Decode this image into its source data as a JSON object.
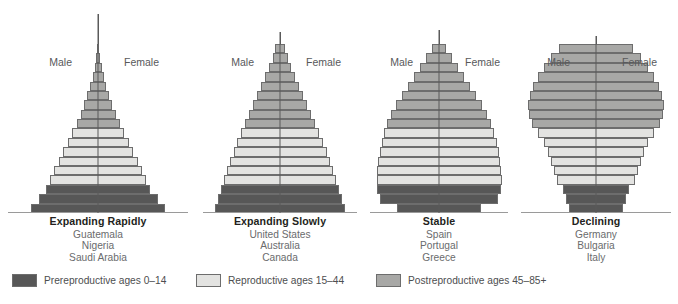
{
  "figure": {
    "sex_labels": {
      "male": "Male",
      "female": "Female"
    }
  },
  "legend": {
    "items": [
      {
        "label": "Prereproductive ages 0–14",
        "color": "#575757",
        "left": 12
      },
      {
        "label": "Reproductive ages 15–44",
        "color": "#e3e3e1",
        "left": 196
      },
      {
        "label": "Postreproductive ages 45–85+",
        "color": "#a8a8a6",
        "left": 376
      }
    ]
  },
  "colors": {
    "prereproductive": "#575757",
    "reproductive": "#e3e3e1",
    "postreproductive": "#a8a8a6",
    "axis": "#5a5a5a",
    "outline": "#6d6d6d",
    "text": "#231f20",
    "muted": "#6a6b6d"
  },
  "chart_data": {
    "type": "bar",
    "xlabel": "",
    "ylabel": "Age",
    "orientation": "horizontal-mirrored",
    "grid": false,
    "legend_position": "bottom",
    "legend_entries": [
      "Prereproductive ages 0–14",
      "Reproductive ages 15–44",
      "Postreproductive ages 45–85+"
    ],
    "age_bands": [
      "85+",
      "80–84",
      "75–79",
      "70–74",
      "65–69",
      "60–64",
      "55–59",
      "50–54",
      "45–49",
      "40–44",
      "35–39",
      "30–34",
      "25–29",
      "20–24",
      "15–19",
      "10–14",
      "5–9",
      "0–4"
    ],
    "categories": [
      "Expanding Rapidly",
      "Expanding Slowly",
      "Stable",
      "Declining"
    ],
    "panels": [
      {
        "title": "Expanding Rapidly",
        "countries": [
          "Guatemala",
          "Nigeria",
          "Saudi Arabia"
        ],
        "shape": "broad-based pyramid",
        "bar_height": 9.4,
        "widths": [
          2,
          4,
          7,
          11,
          16,
          22,
          28,
          35,
          43,
          52,
          61,
          70,
          79,
          88,
          96,
          104,
          119,
          134
        ],
        "groups": [
          "post",
          "post",
          "post",
          "post",
          "post",
          "post",
          "post",
          "post",
          "post",
          "repro",
          "repro",
          "repro",
          "repro",
          "repro",
          "repro",
          "pre",
          "pre",
          "pre"
        ]
      },
      {
        "title": "Expanding Slowly",
        "countries": [
          "United States",
          "Australia",
          "Canada"
        ],
        "shape": "tapered triangle",
        "bar_height": 9.4,
        "widths": [
          10,
          15,
          22,
          30,
          38,
          46,
          54,
          62,
          70,
          78,
          86,
          93,
          100,
          106,
          112,
          118,
          124,
          130
        ],
        "groups": [
          "post",
          "post",
          "post",
          "post",
          "post",
          "post",
          "post",
          "post",
          "post",
          "repro",
          "repro",
          "repro",
          "repro",
          "repro",
          "repro",
          "pre",
          "pre",
          "pre"
        ]
      },
      {
        "title": "Stable",
        "countries": [
          "Spain",
          "Portugal",
          "Greece"
        ],
        "shape": "near-vertical column with tapered apex",
        "bar_height": 9.4,
        "widths": [
          14,
          26,
          38,
          50,
          62,
          74,
          86,
          96,
          104,
          110,
          115,
          119,
          122,
          124,
          125,
          124,
          118,
          84
        ],
        "groups": [
          "post",
          "post",
          "post",
          "post",
          "post",
          "post",
          "post",
          "post",
          "post",
          "repro",
          "repro",
          "repro",
          "repro",
          "repro",
          "repro",
          "pre",
          "pre",
          "pre"
        ]
      },
      {
        "title": "Declining",
        "countries": [
          "Germany",
          "Bulgaria",
          "Italy"
        ],
        "shape": "urn / bulb with narrow base",
        "bar_height": 9.4,
        "widths": [
          74,
          90,
          104,
          116,
          126,
          132,
          136,
          134,
          128,
          116,
          104,
          96,
          90,
          84,
          78,
          66,
          60,
          54
        ],
        "groups": [
          "post",
          "post",
          "post",
          "post",
          "post",
          "post",
          "post",
          "post",
          "post",
          "repro",
          "repro",
          "repro",
          "repro",
          "repro",
          "repro",
          "pre",
          "pre",
          "pre"
        ]
      }
    ]
  }
}
